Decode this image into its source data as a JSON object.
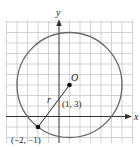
{
  "figure": {
    "axes": {
      "x_label": "x",
      "y_label": "y"
    },
    "center": {
      "label": "O",
      "coords_label": "(1, 3)",
      "x": 1,
      "y": 3
    },
    "point": {
      "coords_label": "(−2, −1)",
      "x": -2,
      "y": -1
    },
    "radius": {
      "label": "r",
      "value": 5
    },
    "colors": {
      "grid": "#c8c8c8",
      "circle": "#666666",
      "axes": "#333333",
      "points": "#111111"
    }
  }
}
